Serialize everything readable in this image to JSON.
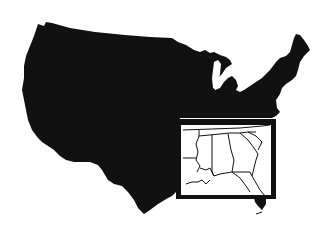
{
  "map": {
    "subject": "Contiguous United States silhouette",
    "highlight_region": "Southeastern United States",
    "inset": {
      "visible": true,
      "states_outlined": [
        "Louisiana",
        "Mississippi",
        "Alabama",
        "Georgia",
        "Tennessee",
        "South Carolina",
        "Florida"
      ]
    },
    "colors": {
      "land": "#111111",
      "background": "#ffffff",
      "inset_frame": "#111111",
      "inset_fill": "#ffffff",
      "state_lines": "#111111"
    },
    "labels": []
  }
}
